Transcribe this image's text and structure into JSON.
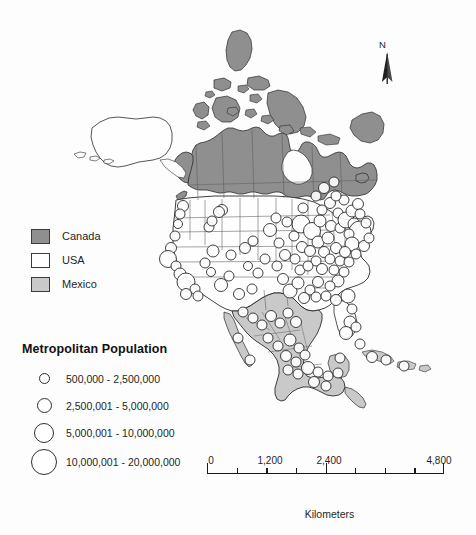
{
  "map": {
    "title": "North America Metropolitan Population",
    "colors": {
      "canada_fill": "#8f8f8f",
      "usa_fill": "#fefefe",
      "mexico_fill": "#c9c9c9",
      "outline": "#2b2b2b",
      "state_outline": "#555555",
      "circle_fill": "#ffffff",
      "circle_stroke": "#2b2b2b",
      "background": "#fdfdfd"
    }
  },
  "north_arrow": {
    "label": "N",
    "icon": "north-arrow-icon"
  },
  "country_legend": {
    "items": [
      {
        "label": "Canada",
        "color": "#8f8f8f"
      },
      {
        "label": "USA",
        "color": "#ffffff"
      },
      {
        "label": "Mexico",
        "color": "#c9c9c9"
      }
    ]
  },
  "population_legend": {
    "title": "Metropolitan Population",
    "classes": [
      {
        "label": "500,000 - 2,500,000",
        "diameter": 11,
        "min": 500000,
        "max": 2500000
      },
      {
        "label": "2,500,001 - 5,000,000",
        "diameter": 15,
        "min": 2500001,
        "max": 5000000
      },
      {
        "label": "5,000,001 - 10,000,000",
        "diameter": 20,
        "min": 5000001,
        "max": 10000000
      },
      {
        "label": "10,000,001 - 20,000,000",
        "diameter": 26,
        "min": 10000001,
        "max": 20000000
      }
    ]
  },
  "scale_bar": {
    "unit": "Kilometers",
    "max": 4800,
    "labels": [
      {
        "text": "0",
        "value": 0
      },
      {
        "text": "1,200",
        "value": 1200
      },
      {
        "text": "2,400",
        "value": 2400
      },
      {
        "text": "4,800",
        "value": 4800
      }
    ],
    "ticks": [
      0,
      600,
      1200,
      1800,
      2400,
      3000,
      3600,
      4200,
      4800
    ],
    "major_ticks": [
      0,
      2400,
      4800
    ]
  }
}
